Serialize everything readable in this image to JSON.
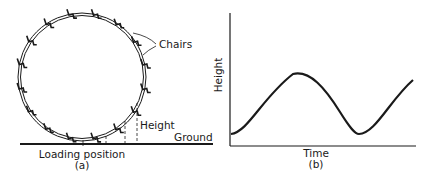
{
  "panel_a": {
    "labels": {
      "chairs": "Chairs",
      "height": "Height",
      "ground": "Ground",
      "loading_position": "Loading position",
      "caption": "(a)"
    },
    "wheel": {
      "cx": 82,
      "cy": 77,
      "r": 63,
      "chair_count": 16
    },
    "ground_y": 144
  },
  "panel_b": {
    "labels": {
      "ylabel": "Height",
      "xlabel": "Time",
      "caption": "(b)"
    }
  },
  "chart_data": {
    "type": "line",
    "title": "",
    "xlabel": "Time",
    "ylabel": "Height",
    "caption": "(b)",
    "grid": false,
    "x": [
      0,
      0.1,
      0.2,
      0.3,
      0.35,
      0.45,
      0.55,
      0.65,
      0.8,
      0.95,
      1.0
    ],
    "series": [
      {
        "name": "Height",
        "values": [
          0.15,
          0.27,
          0.5,
          0.74,
          0.8,
          0.72,
          0.4,
          0.15,
          0.25,
          0.62,
          0.75
        ]
      }
    ],
    "xlim": [
      0,
      1
    ],
    "ylim": [
      0,
      1.2
    ]
  },
  "colors": {
    "ink": "#1a1a1a",
    "background": "#ffffff"
  }
}
